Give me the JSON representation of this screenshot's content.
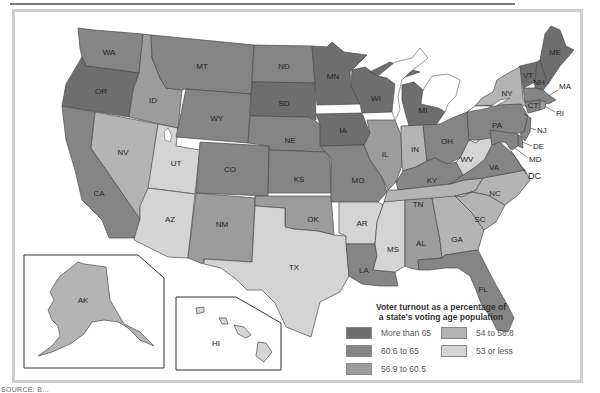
{
  "legend": {
    "title_line1": "Voter turnout as a percentage of",
    "title_line2": "a state's voting age population",
    "items": [
      {
        "label": "More than 65",
        "color": "#6e6e6e"
      },
      {
        "label": "54 to 56.8",
        "color": "#b4b4b4"
      },
      {
        "label": "60.6 to 65",
        "color": "#858585"
      },
      {
        "label": "53 or less",
        "color": "#d4d4d4"
      },
      {
        "label": "56.9 to 60.5",
        "color": "#9c9c9c"
      }
    ]
  },
  "source_text": "SOURCE: B...",
  "states": {
    "WA": "WA",
    "OR": "OR",
    "CA": "CA",
    "ID": "ID",
    "NV": "NV",
    "UT": "UT",
    "AZ": "AZ",
    "MT": "MT",
    "WY": "WY",
    "CO": "CO",
    "NM": "NM",
    "ND": "ND",
    "SD": "SD",
    "NE": "NE",
    "KS": "KS",
    "OK": "OK",
    "TX": "TX",
    "MN": "MN",
    "IA": "IA",
    "MO": "MO",
    "AR": "AR",
    "LA": "LA",
    "WI": "WI",
    "IL": "IL",
    "MI": "MI",
    "IN": "IN",
    "OH": "OH",
    "KY": "KY",
    "TN": "TN",
    "MS": "MS",
    "AL": "AL",
    "GA": "GA",
    "FL": "FL",
    "SC": "SC",
    "NC": "NC",
    "VA": "VA",
    "WV": "WV",
    "PA": "PA",
    "NY": "NY",
    "VT": "VT",
    "NH": "NH",
    "ME": "ME",
    "MA": "MA",
    "CT": "CT",
    "RI": "RI",
    "NJ": "NJ",
    "DE": "DE",
    "MD": "MD",
    "DC": "DC",
    "AK": "AK",
    "HI": "HI"
  },
  "turnout_category": {
    "more_than_65": [
      "OR",
      "MN",
      "WI",
      "IA",
      "MI",
      "ME",
      "VT",
      "NH",
      "SD"
    ],
    "60_6_to_65": [
      "WA",
      "MT",
      "WY",
      "CO",
      "CA",
      "MO",
      "KS",
      "NE",
      "OH",
      "PA",
      "MA",
      "CT",
      "FL",
      "LA",
      "ND",
      "KY",
      "VA",
      "NJ",
      "DE",
      "MD"
    ],
    "56_9_to_60_5": [
      "ID",
      "IL",
      "NM",
      "OK",
      "AL",
      "NC",
      "RI"
    ],
    "54_to_56_8": [
      "NV",
      "IN",
      "NY",
      "TN",
      "AK",
      "SC",
      "GA"
    ],
    "53_or_less": [
      "UT",
      "AZ",
      "TX",
      "AR",
      "MS",
      "WV",
      "HI"
    ]
  }
}
